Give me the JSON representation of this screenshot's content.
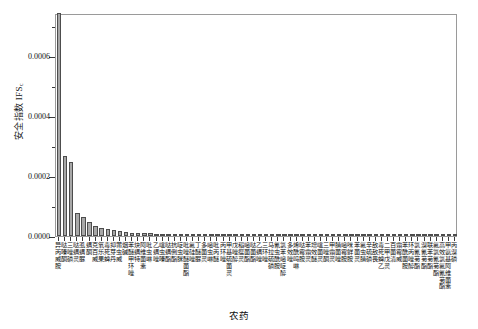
{
  "chart_data": {
    "type": "bar",
    "title": "",
    "xlabel": "农药",
    "ylabel": "安全指数 IFS",
    "ylabel_sub": "c",
    "ylim": [
      0,
      0.000745
    ],
    "ytick_values": [
      0.0,
      0.0002,
      0.0004,
      0.0006
    ],
    "ytick_labels": [
      "0.0000",
      "0.0002",
      "0.0004",
      "0.0006"
    ],
    "grid": false,
    "legend": null,
    "bar_color": "#a8a8a8",
    "bar_edge_color": "#4d4d4d",
    "categories": [
      "异丙威胺",
      "哒嗪酮",
      "三唑磷",
      "哒螨灵",
      "虱螨脲",
      "螨酮",
      "克百威",
      "氧乐果",
      "毒死蜱",
      "抑芽丹",
      "莆虫威",
      "烟碱",
      "苯醚甲环唑",
      "炔螨特",
      "阿维菌素",
      "吡虫啉",
      "乙螨唑",
      "噻虫嗪",
      "哒螨酯",
      "抗倒酯",
      "啶虫脒",
      "吡唑醚菌酯",
      "氟硅唑",
      "丁醚脲",
      "多菌灵",
      "嘧虫啉",
      "吡丙醚",
      "丙环唑",
      "甲基硫菌灵",
      "戊唑醇",
      "稻瘟灵",
      "嘧菌酯",
      "哒菌酯",
      "乙螨唑",
      "三环唑",
      "马拉硫磷",
      "氰虫酰胺",
      "氯苯嘧啶醇",
      "多效唑",
      "烯酰吗啉",
      "哒霉胺",
      "苯霜灵",
      "增效醚",
      "噻菌灵",
      "三唑酮",
      "甲霜灵",
      "腈菌唑",
      "嘧霉胺",
      "咪鲜胺",
      "苯菌灵",
      "氟虫腈",
      "辛硫磷",
      "敌敌畏",
      "毒死蜱乙",
      "二甲戊灵",
      "百菌清",
      "霜霉威",
      "苯酰菌胺",
      "环丙唑醇",
      "氯氰菊酯",
      "溴氰菊酯",
      "联苯菊酯",
      "氟氯氰菊酯",
      "高效氯氟氰菊酯",
      "甲氨基阿维菌素",
      "丙溴磷"
    ],
    "values": [
      0.000745,
      0.000268,
      0.000246,
      7.55e-05,
      6.45e-05,
      4.65e-05,
      3.35e-05,
      2.55e-05,
      2.48e-05,
      2.15e-05,
      1.52e-05,
      1.4e-05,
      1.15e-05,
      1.05e-05,
      9.8e-06,
      9e-06,
      8.2e-06,
      7.6e-06,
      7e-06,
      6.4e-06,
      6e-06,
      5.6e-06,
      5.2e-06,
      4.9e-06,
      4.6e-06,
      4.3e-06,
      4.1e-06,
      3.9e-06,
      3.7e-06,
      3.5e-06,
      3.3e-06,
      3.1e-06,
      3e-06,
      2.8e-06,
      2.7e-06,
      2.6e-06,
      2.5e-06,
      2.4e-06,
      2.3e-06,
      2.2e-06,
      2.1e-06,
      2e-06,
      1.9e-06,
      1.8e-06,
      1.7e-06,
      1.7e-06,
      1.6e-06,
      1.5e-06,
      1.5e-06,
      1.4e-06,
      1.4e-06,
      1.3e-06,
      1.2e-06,
      1.2e-06,
      1.1e-06,
      1.1e-06,
      1e-06,
      1e-06,
      9e-07,
      9e-07,
      8e-07,
      8e-07,
      7e-07,
      7e-07,
      6e-07,
      6e-07
    ]
  }
}
